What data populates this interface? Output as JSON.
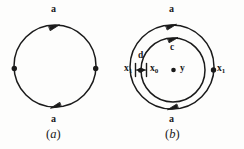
{
  "figure": {
    "stroke_color": "#1a1a1a",
    "background_color": "#fdfdfc",
    "panels": [
      {
        "id": "a",
        "caption_open": "(",
        "caption_letter": "a",
        "caption_close": ")",
        "circles": [
          {
            "name": "main-circle",
            "cx": 55,
            "cy": 66,
            "r": 41
          }
        ],
        "labels": [
          {
            "name": "top-arc-label",
            "text": "a"
          },
          {
            "name": "bottom-arc-label",
            "text": "a"
          }
        ],
        "arrows": [
          {
            "name": "top-arrow",
            "direction": "clockwise-right"
          },
          {
            "name": "bottom-arrow",
            "direction": "clockwise-left"
          }
        ],
        "points": [
          {
            "name": "left-point",
            "cx": 14,
            "cy": 69
          },
          {
            "name": "right-point",
            "cx": 96,
            "cy": 69
          }
        ]
      },
      {
        "id": "b",
        "caption_open": "(",
        "caption_letter": "b",
        "caption_close": ")",
        "circles": [
          {
            "name": "outer-circle",
            "cx": 172,
            "cy": 67,
            "r": 42
          },
          {
            "name": "inner-circle",
            "cx": 173,
            "cy": 70,
            "r": 32
          }
        ],
        "labels": [
          {
            "name": "outer-top-label",
            "text": "a"
          },
          {
            "name": "outer-bottom-label",
            "text": "a"
          },
          {
            "name": "inner-top-label",
            "text": "c"
          },
          {
            "name": "gap-label",
            "text": "d"
          },
          {
            "name": "left-boundary-label",
            "text": "x",
            "sub": "1"
          },
          {
            "name": "right-boundary-label",
            "text": "x",
            "sub": "1"
          },
          {
            "name": "inner-left-label",
            "text": "x",
            "sub": "0"
          },
          {
            "name": "center-label",
            "text": "y"
          }
        ],
        "arrows": [
          {
            "name": "outer-top-arrow",
            "direction": "clockwise-right"
          },
          {
            "name": "outer-bottom-arrow",
            "direction": "clockwise-left"
          },
          {
            "name": "inner-top-arrow",
            "direction": "clockwise-right"
          },
          {
            "name": "dimension-arrow",
            "direction": "double-headed-horizontal"
          }
        ],
        "points": [
          {
            "name": "center-point",
            "cx": 174,
            "cy": 70
          },
          {
            "name": "outer-right-point",
            "cx": 213,
            "cy": 70
          },
          {
            "name": "outer-left-point",
            "cx": 140,
            "cy": 70
          }
        ]
      }
    ]
  }
}
